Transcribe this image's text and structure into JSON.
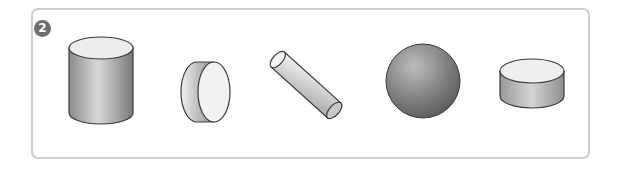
{
  "problem": {
    "number_label": "2"
  },
  "shapes": [
    {
      "id": "cylinder",
      "label": "upright cylinder"
    },
    {
      "id": "short-cylinder-side",
      "label": "short cylinder on its side"
    },
    {
      "id": "tilted-rod",
      "label": "tilted cylinder rod"
    },
    {
      "id": "sphere",
      "label": "sphere"
    },
    {
      "id": "flat-disc",
      "label": "flat cylinder disc"
    }
  ],
  "colors": {
    "border": "#cfcfcf",
    "marker": "#6e6e6e",
    "outline": "#3a3a3a",
    "top_face": "#ececec"
  }
}
